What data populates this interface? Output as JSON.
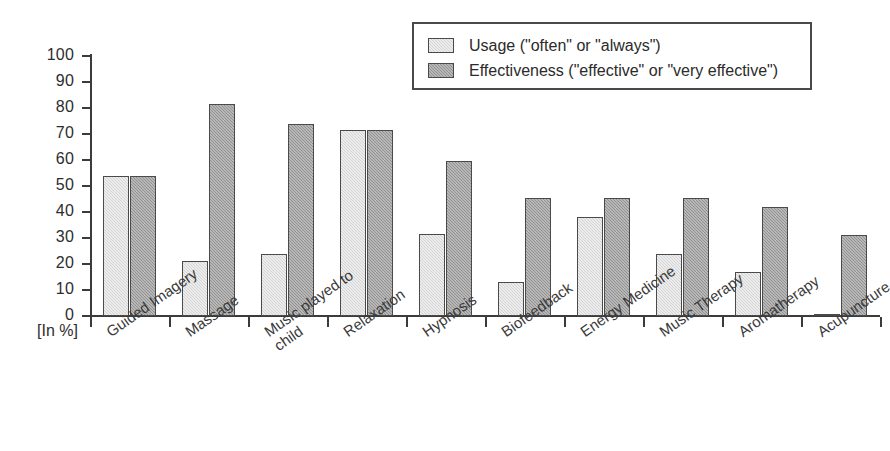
{
  "chart_data": {
    "type": "bar",
    "title": "",
    "xlabel": "",
    "ylabel": "[In %]",
    "ylim": [
      0,
      100
    ],
    "ytick_step": 10,
    "yticks": [
      100,
      90,
      80,
      70,
      60,
      50,
      40,
      30,
      20,
      10,
      0
    ],
    "grid": false,
    "legend_position": "top-right",
    "categories": [
      "Guided Imagery",
      "Massage",
      "Music played to\nchild",
      "Relaxation",
      "Hypnosis",
      "Biofeedback",
      "Energy Medicine",
      "Music Therapy",
      "Aromatherapy",
      "Acupuncture"
    ],
    "series": [
      {
        "name": "Usage (\"often\" or \"always\")",
        "color": "#d4d4d4",
        "values": [
          54,
          21,
          24,
          71.5,
          31.5,
          13,
          38,
          24,
          17,
          0.5
        ]
      },
      {
        "name": "Effectiveness (\"effective\" or \"very effective\")",
        "color": "#919191",
        "values": [
          54,
          81.5,
          74,
          71.5,
          59.5,
          45.5,
          45.5,
          45.5,
          42,
          31
        ]
      }
    ]
  },
  "legend": {
    "items": [
      {
        "label": "Usage (\"often\" or \"always\")",
        "swatch": "usage"
      },
      {
        "label": "Effectiveness (\"effective\" or \"very effective\")",
        "swatch": "effect"
      }
    ]
  },
  "axis": {
    "unit_label": "[In %]"
  }
}
